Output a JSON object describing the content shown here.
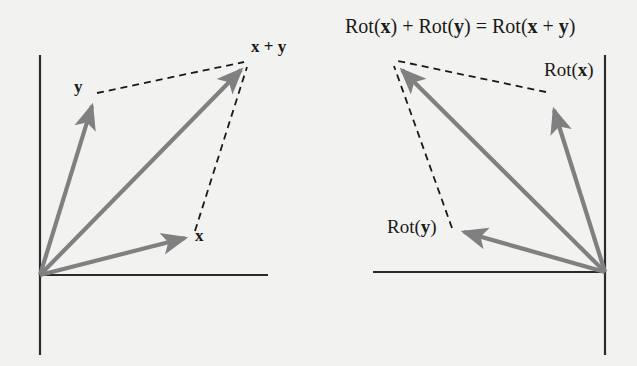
{
  "figure": {
    "title_caption": "Rot(x) + Rot(y) = Rot(x + y)",
    "background_color": "#f2f2f0",
    "vector_color": "#808080",
    "axis_color": "#2b2b2b",
    "dash_color": "#1a1a1a",
    "text_color": "#1a1a1a"
  },
  "left_panel": {
    "name": "vector-addition-diagram",
    "origin": {
      "x": 40,
      "y": 275
    },
    "axes": {
      "vertical": {
        "x": 40,
        "y1": 55,
        "y2": 355
      },
      "horizontal": {
        "y": 275,
        "x1": 40,
        "x2": 268
      }
    },
    "vectors": [
      {
        "id": "y",
        "label": "y",
        "label_html": "<b>y</b>",
        "from": [
          40,
          275
        ],
        "to": [
          95,
          97
        ],
        "label_pos": [
          75,
          80
        ]
      },
      {
        "id": "x_plus_y",
        "label": "x + y",
        "label_html": "<b>x</b> + <b>y</b>",
        "from": [
          40,
          275
        ],
        "to": [
          246,
          64
        ],
        "label_pos": [
          252,
          39
        ]
      },
      {
        "id": "x",
        "label": "x",
        "label_html": "<b>x</b>",
        "from": [
          40,
          275
        ],
        "to": [
          192,
          236
        ],
        "label_pos": [
          196,
          228
        ]
      }
    ],
    "dashed_edges": [
      {
        "id": "y-to-sum",
        "from": [
          97,
          93
        ],
        "to": [
          246,
          62
        ]
      },
      {
        "id": "x-to-sum",
        "from": [
          195,
          231
        ],
        "to": [
          248,
          66
        ]
      }
    ]
  },
  "right_panel": {
    "name": "rotated-vector-addition-diagram",
    "origin": {
      "x": 605,
      "y": 272
    },
    "axes": {
      "vertical": {
        "x": 605,
        "y1": 55,
        "y2": 355
      },
      "horizontal": {
        "y": 272,
        "x1": 373,
        "x2": 605
      }
    },
    "vectors": [
      {
        "id": "rot_x",
        "label": "Rot(x)",
        "label_html": "Rot(<b>x</b>)",
        "from": [
          605,
          272
        ],
        "to": [
          551,
          100
        ],
        "label_pos": [
          545,
          60
        ]
      },
      {
        "id": "rot_sum",
        "label": "Rot(x + y) arrow",
        "label_html": "",
        "from": [
          605,
          272
        ],
        "to": [
          395,
          62
        ],
        "label_pos": [
          0,
          0
        ]
      },
      {
        "id": "rot_y",
        "label": "Rot(y)",
        "label_html": "Rot(<b>y</b>)",
        "from": [
          605,
          272
        ],
        "to": [
          455,
          234
        ],
        "label_pos": [
          388,
          217
        ]
      }
    ],
    "title_label": {
      "text": "Rot(x) + Rot(y) = Rot(x + y)",
      "html": "Rot(<b>x</b>) + Rot(<b>y</b>) = Rot(<b>x</b> + <b>y</b>)",
      "pos": [
        345,
        16
      ]
    },
    "dashed_edges": [
      {
        "id": "rotx-to-sum",
        "from": [
          546,
          92
        ],
        "to": [
          396,
          60
        ]
      },
      {
        "id": "roty-to-sum",
        "from": [
          452,
          228
        ],
        "to": [
          392,
          66
        ]
      }
    ]
  }
}
